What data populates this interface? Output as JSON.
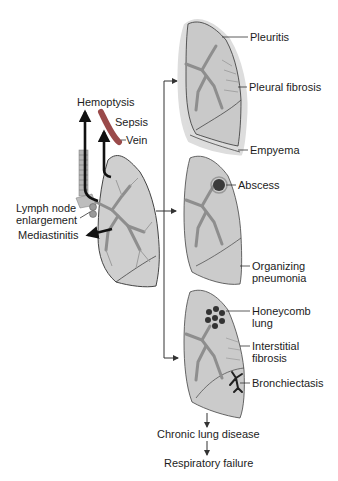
{
  "diagram": {
    "center_lung": {
      "labels": {
        "hemoptysis": "Hemoptysis",
        "sepsis": "Sepsis",
        "vein": "Vein",
        "lymph_node": "Lymph node\nenlargement",
        "mediastinitis": "Mediastinitis"
      }
    },
    "top_lung": {
      "labels": {
        "pleuritis": "Pleuritis",
        "pleural_fibrosis": "Pleural fibrosis",
        "empyema": "Empyema"
      }
    },
    "middle_lung": {
      "labels": {
        "abscess": "Abscess",
        "organizing_pneumonia": "Organizing\npneumonia"
      }
    },
    "bottom_lung": {
      "labels": {
        "honeycomb": "Honeycomb\nlung",
        "interstitial_fibrosis": "Interstitial\nfibrosis",
        "bronchiectasis": "Bronchiectasis"
      }
    },
    "outcomes": {
      "chronic": "Chronic lung disease",
      "failure": "Respiratory failure"
    },
    "colors": {
      "lung_fill": "#c9c9c9",
      "pleura_fill": "#dcdcdc",
      "airway": "#8e8e8e",
      "outline": "#2a2a2a",
      "vein": "#9a4a4a",
      "abscess": "#3a3a3a"
    }
  }
}
